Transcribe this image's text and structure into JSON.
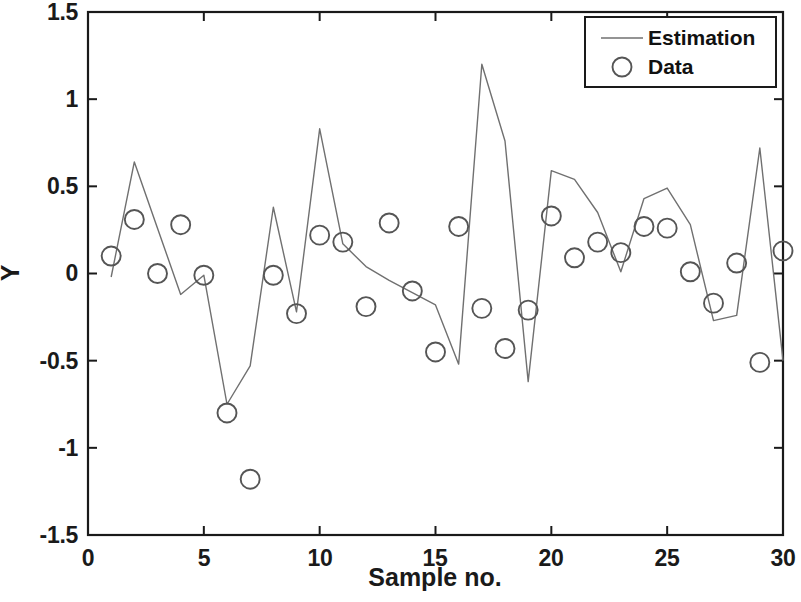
{
  "chart_data": {
    "type": "line",
    "title": "",
    "xlabel": "Sample no.",
    "ylabel": "Y",
    "xlim": [
      0,
      30
    ],
    "ylim": [
      -1.5,
      1.5
    ],
    "xticks": [
      0,
      5,
      10,
      15,
      20,
      25,
      30
    ],
    "xtick_labels": [
      "0",
      "5",
      "10",
      "15",
      "20",
      "25",
      "30"
    ],
    "yticks": [
      -1.5,
      -1,
      -0.5,
      0,
      0.5,
      1,
      1.5
    ],
    "ytick_labels": [
      "-1.5",
      "-1",
      "-0.5",
      "0",
      "0.5",
      "1",
      "1.5"
    ],
    "grid": false,
    "legend_position": "top-right",
    "legend": [
      {
        "label": "Estimation",
        "marker": "line",
        "color": "#707070"
      },
      {
        "label": "Data",
        "marker": "circle",
        "color": "#555555"
      }
    ],
    "x": [
      1,
      2,
      3,
      4,
      5,
      6,
      7,
      8,
      9,
      10,
      11,
      12,
      13,
      14,
      15,
      16,
      17,
      18,
      19,
      20,
      21,
      22,
      23,
      24,
      25,
      26,
      27,
      28,
      29,
      30
    ],
    "series": [
      {
        "name": "Estimation",
        "type": "line",
        "values": [
          -0.02,
          0.64,
          0.26,
          -0.12,
          -0.01,
          -0.75,
          -0.53,
          0.38,
          -0.22,
          0.83,
          0.17,
          0.04,
          -0.04,
          -0.11,
          -0.18,
          -0.52,
          1.2,
          0.76,
          -0.62,
          0.59,
          0.54,
          0.35,
          0.01,
          0.43,
          0.49,
          0.28,
          -0.27,
          -0.24,
          0.72,
          -0.5
        ]
      },
      {
        "name": "Data",
        "type": "scatter",
        "values": [
          0.1,
          0.31,
          0.0,
          0.28,
          -0.01,
          -0.8,
          -1.18,
          -0.01,
          -0.23,
          0.22,
          0.18,
          -0.19,
          0.29,
          -0.1,
          -0.45,
          0.27,
          -0.2,
          -0.43,
          -0.21,
          0.33,
          0.09,
          0.18,
          0.12,
          0.27,
          0.26,
          0.01,
          -0.17,
          0.06,
          -0.51,
          0.13
        ]
      }
    ]
  },
  "axes": {
    "x_tick_labels": [
      "0",
      "5",
      "10",
      "15",
      "20",
      "25",
      "30"
    ],
    "y_tick_labels": [
      "1.5",
      "1",
      "0.5",
      "0",
      "-0.5",
      "-1",
      "-1.5"
    ],
    "x_axis_title": "Sample no.",
    "y_axis_title": "Y"
  },
  "legend": {
    "estimation_label": "Estimation",
    "data_label": "Data"
  },
  "style": {
    "line_color": "#707070",
    "marker_color": "#555555",
    "axis_color": "#1a1a1a",
    "background": "#ffffff"
  }
}
